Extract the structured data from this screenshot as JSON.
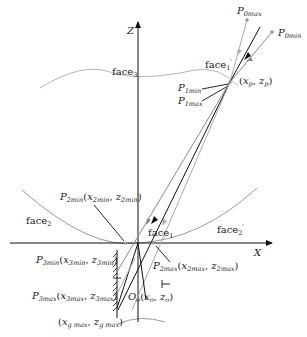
{
  "diagram": {
    "type": "optical ray geometry",
    "axes": {
      "z_label": "Z",
      "x_label": "X"
    },
    "faces": {
      "face3": "face",
      "face3_sub": "3",
      "face1p": "face",
      "face1p_sub": "1",
      "face1p_prime": "′",
      "face2": "face",
      "face2_sub": "2",
      "face2p": "face",
      "face2p_sub": "2",
      "face2p_prime": "′",
      "face1": "face",
      "face1_sub": "1"
    },
    "points": {
      "p0max": {
        "main": "P",
        "sub": "0max"
      },
      "p0min": {
        "main": "P",
        "sub": "0min"
      },
      "p1min": {
        "main": "P",
        "sub": "1min"
      },
      "p1max": {
        "main": "P",
        "sub": "1max"
      },
      "pivot": {
        "open": "(",
        "x": "x",
        "xsub": "p",
        "sep": ", ",
        "z": "z",
        "zsub": "p",
        "close": ")"
      },
      "p2min": {
        "main": "P",
        "sub": "2min",
        "open": "(",
        "x": "x",
        "xsub": "2min",
        "sep": ", ",
        "z": "z",
        "zsub": "2min",
        "close": ")"
      },
      "p2max": {
        "main": "P",
        "sub": "2max",
        "open": "(",
        "x": "x",
        "xsub": "2max",
        "sep": ", ",
        "z": "z",
        "zsub": "2max",
        "close": ")"
      },
      "p3min": {
        "main": "P",
        "sub": "3min",
        "open": "(",
        "x": "x",
        "xsub": "3min",
        "sep": ", ",
        "z": "z",
        "zsub": "3min",
        "close": ")"
      },
      "p3max": {
        "main": "P",
        "sub": "3max",
        "open": "(",
        "x": "x",
        "xsub": "3max",
        "sep": ", ",
        "z": "z",
        "zsub": "3max",
        "close": ")"
      },
      "origin": {
        "main": "O",
        "sub": "o",
        "open": "(",
        "x": "x",
        "xsub": "o",
        "sep": ", ",
        "z": "z",
        "zsub": "o",
        "close": ")"
      },
      "gmax": {
        "open": "(",
        "x": "x",
        "xsub": "g max",
        "sep": ", ",
        "z": "z",
        "zsub": "g max",
        "close": ")"
      }
    },
    "colors": {
      "axis": "#111111",
      "ray_dark": "#111111",
      "ray_gray": "#8a8a8a",
      "ray_light": "#b0b0b0",
      "face_curve": "#9a9a9a"
    }
  }
}
